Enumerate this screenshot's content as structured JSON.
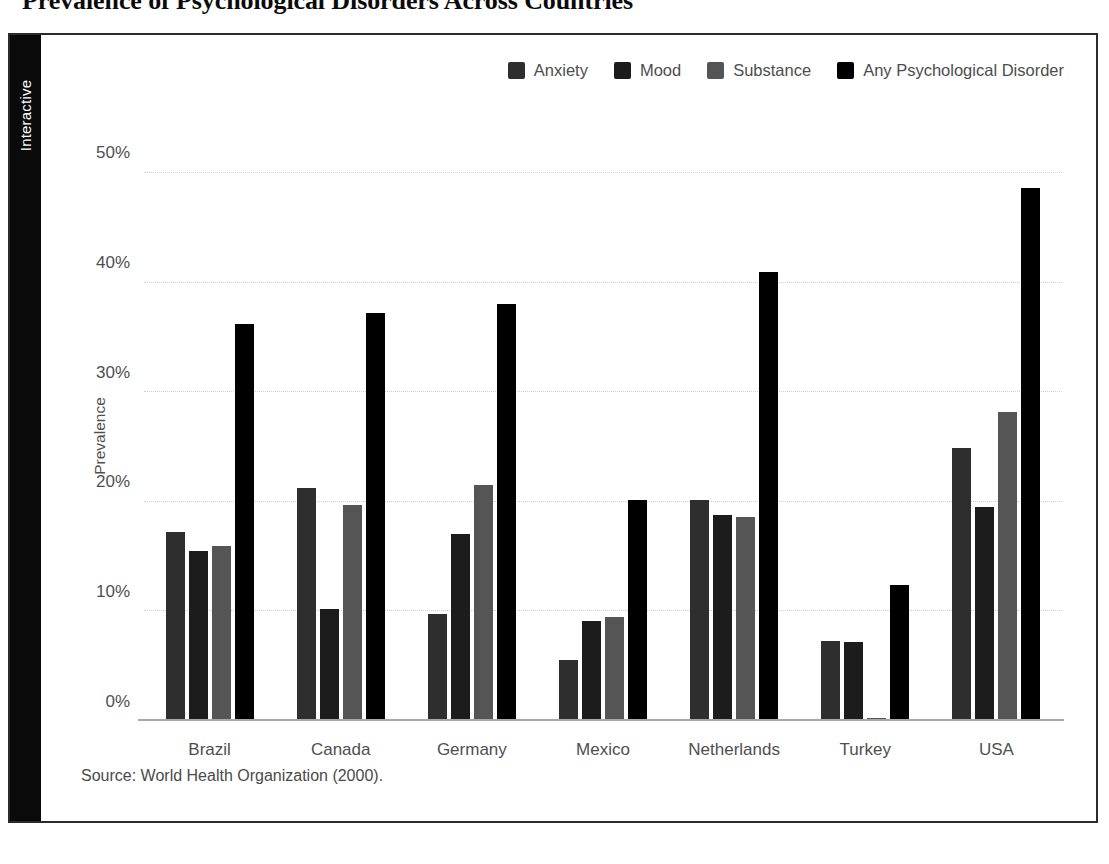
{
  "page": {
    "title": "Prevalence of Psychological Disorders Across Countries",
    "side_tab_label": "Interactive"
  },
  "colors": {
    "anxiety": "#2e2e2e",
    "mood": "#1c1c1c",
    "substance": "#555555",
    "any": "#000000",
    "gridline": "#cfcfcf",
    "axis": "#a8a8a8",
    "tick_text": "#4f4f4f",
    "legend_text": "#4d4d4d",
    "tab_background": "#0a0a0a",
    "tab_text": "#ffffff"
  },
  "legend": {
    "items": [
      {
        "label": "Anxiety",
        "color": "#2e2e2e"
      },
      {
        "label": "Mood",
        "color": "#1c1c1c"
      },
      {
        "label": "Substance",
        "color": "#555555"
      },
      {
        "label": "Any Psychological Disorder",
        "color": "#000000"
      }
    ]
  },
  "axes": {
    "y_label": "Prevalence",
    "y_ticks": [
      "0%",
      "10%",
      "20%",
      "30%",
      "40%",
      "50%"
    ],
    "y_tick_values": [
      0,
      10,
      20,
      30,
      40,
      50
    ]
  },
  "source": {
    "text": "Source: World Health Organization (2000)."
  },
  "chart_data": {
    "type": "bar",
    "title": "Prevalence of Psychological Disorders Across Countries",
    "xlabel": "",
    "ylabel": "Prevalence",
    "ylim": [
      0,
      52
    ],
    "grid": true,
    "legend_position": "top-right",
    "annotations": [
      "Source: World Health Organization (2000)."
    ],
    "categories": [
      "Brazil",
      "Canada",
      "Germany",
      "Mexico",
      "Netherlands",
      "Turkey",
      "USA"
    ],
    "series": [
      {
        "name": "Anxiety",
        "color": "#2e2e2e",
        "values": [
          17.2,
          21.3,
          9.8,
          5.6,
          20.2,
          7.3,
          24.9
        ]
      },
      {
        "name": "Mood",
        "color": "#1c1c1c",
        "values": [
          15.5,
          10.2,
          17.1,
          9.1,
          18.8,
          7.2,
          19.5
        ]
      },
      {
        "name": "Substance",
        "color": "#555555",
        "values": [
          16.0,
          19.7,
          21.5,
          9.5,
          18.6,
          0.3,
          28.2
        ]
      },
      {
        "name": "Any Psychological Disorder",
        "color": "#000000",
        "values": [
          36.2,
          37.2,
          38.0,
          20.2,
          41.0,
          12.4,
          48.6
        ]
      }
    ]
  }
}
